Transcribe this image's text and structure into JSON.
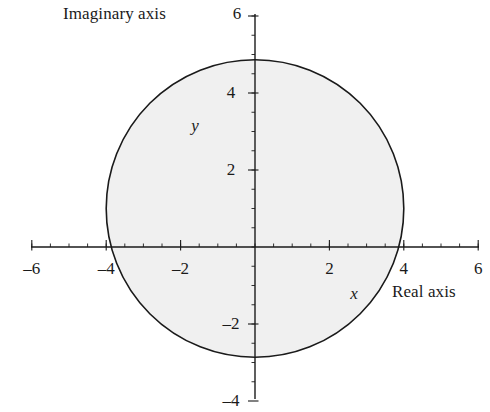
{
  "chart_data": {
    "type": "scatter",
    "title": "",
    "subtitle": "",
    "xlabel": "Real axis",
    "ylabel": "Imaginary axis",
    "xlim": [
      -6,
      6
    ],
    "ylim": [
      -4,
      6
    ],
    "grid": false,
    "legend": null,
    "x_ticks": [
      -6,
      -4,
      -2,
      2,
      4,
      6
    ],
    "x_tick_labels": [
      "–6",
      "–4",
      "–2",
      "2",
      "4",
      "6"
    ],
    "y_ticks": [
      -4,
      -2,
      2,
      4,
      6
    ],
    "y_tick_labels": [
      "–4",
      "–2",
      "2",
      "4",
      "6"
    ],
    "x_minor_tick_step": 0.5,
    "y_minor_tick_step": 0.5,
    "annotations": [
      {
        "text": "y",
        "x": -1.6,
        "y": 3.2,
        "style": "italic"
      },
      {
        "text": "x",
        "x": 2.65,
        "y": -0.95,
        "style": "italic"
      },
      {
        "text": "Imaginary axis",
        "x": -5.1,
        "y": 6.0,
        "style": "upright"
      },
      {
        "text": "Real axis",
        "x": 3.7,
        "y": -1.35,
        "style": "upright"
      }
    ],
    "shapes": [
      {
        "kind": "circle",
        "label": "shaded-disk",
        "center_x": 0,
        "center_y": 1,
        "radius": 4,
        "fill": "#f0f0f0",
        "stroke": "#1a1a1a",
        "stroke_width": 1.6,
        "filled": true
      }
    ]
  },
  "colors": {
    "axis": "#1a1a1a",
    "text": "#1a1a1a",
    "disk_fill": "#f0f0f0",
    "disk_stroke": "#1a1a1a",
    "background": "#ffffff"
  },
  "geometry": {
    "origin_x": 255,
    "origin_y": 247,
    "px_per_unit_x": 37.2,
    "px_per_unit_y": 38.5,
    "x_axis_left_px": 31,
    "x_axis_right_px": 479,
    "y_axis_top_px": 14,
    "y_axis_bottom_px": 399
  },
  "ticks": {
    "major_len_px": 7,
    "minor_len_px": 3.5
  },
  "labels": {
    "imaginary_axis": "Imaginary axis",
    "real_axis": "Real axis",
    "x_var": "x",
    "y_var": "y"
  }
}
